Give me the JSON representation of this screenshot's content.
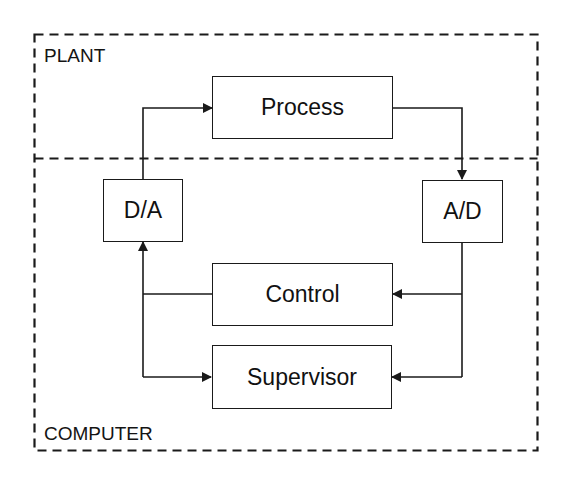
{
  "diagram": {
    "zones": {
      "plant": {
        "label": "PLANT"
      },
      "computer": {
        "label": "COMPUTER"
      }
    },
    "blocks": {
      "process": {
        "label": "Process"
      },
      "da": {
        "label": "D/A"
      },
      "ad": {
        "label": "A/D"
      },
      "control": {
        "label": "Control"
      },
      "supervisor": {
        "label": "Supervisor"
      }
    },
    "connections": [
      {
        "from": "D/A",
        "to": "Process",
        "type": "arrow"
      },
      {
        "from": "Process",
        "to": "A/D",
        "type": "arrow"
      },
      {
        "from": "A/D",
        "to": "Control",
        "type": "arrow"
      },
      {
        "from": "A/D",
        "to": "Supervisor",
        "type": "arrow"
      },
      {
        "from": "Control",
        "to": "D/A",
        "type": "arrow"
      },
      {
        "from": "Supervisor",
        "to": "D/A",
        "type": "bidirectional-arrow"
      }
    ],
    "colors": {
      "line": "#1a1a1a",
      "background": "#ffffff"
    }
  }
}
